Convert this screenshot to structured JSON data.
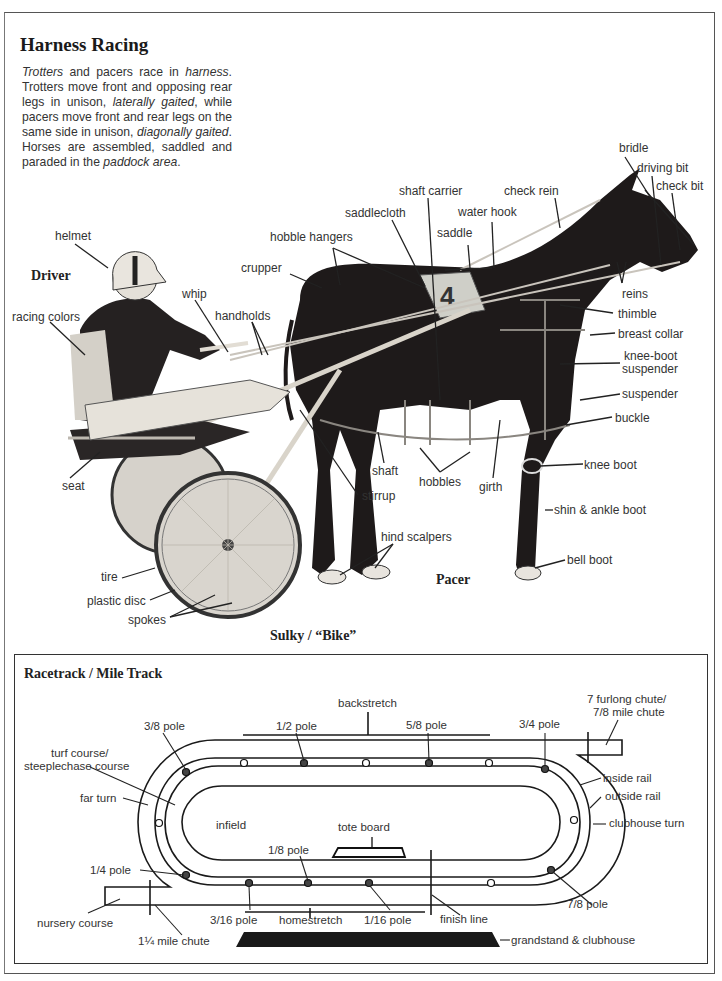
{
  "header": {
    "title": "Harness Racing",
    "intro": [
      {
        "text": "Trotters",
        "italic": true
      },
      {
        "text": " and pacers race in ",
        "italic": false
      },
      {
        "text": "harness",
        "italic": true
      },
      {
        "text": ". Trotters move front and opposing rear legs in unison, ",
        "italic": false
      },
      {
        "text": "laterally gaited",
        "italic": true
      },
      {
        "text": ", while pacers move front and rear legs on the same side in unison, ",
        "italic": false
      },
      {
        "text": "diagonally gaited",
        "italic": true
      },
      {
        "text": ". Horses are assembled, saddled and paraded in the ",
        "italic": false
      },
      {
        "text": "paddock area",
        "italic": true
      },
      {
        "text": ".",
        "italic": false
      }
    ]
  },
  "horse_diagram": {
    "section_labels": {
      "driver": "Driver",
      "pacer": "Pacer",
      "sulky": "Sulky / “Bike”"
    },
    "labels": {
      "helmet": "helmet",
      "racing_colors": "racing colors",
      "whip": "whip",
      "handholds": "handholds",
      "crupper": "crupper",
      "hobble_hangers": "hobble hangers",
      "saddlecloth": "saddlecloth",
      "shaft_carrier": "shaft carrier",
      "saddle": "saddle",
      "water_hook": "water hook",
      "check_rein": "check rein",
      "bridle": "bridle",
      "driving_bit": "driving bit",
      "check_bit": "check bit",
      "reins": "reins",
      "thimble": "thimble",
      "breast_collar": "breast collar",
      "knee_boot_suspender_1": "knee-boot",
      "knee_boot_suspender_2": "suspender",
      "suspender": "suspender",
      "buckle": "buckle",
      "knee_boot": "knee boot",
      "shin_ankle_boot": "shin & ankle boot",
      "bell_boot": "bell boot",
      "seat": "seat",
      "shaft": "shaft",
      "stirrup": "stirrup",
      "hobbles": "hobbles",
      "girth": "girth",
      "hind_scalpers": "hind scalpers",
      "tire": "tire",
      "plastic_disc": "plastic disc",
      "spokes": "spokes"
    }
  },
  "track_diagram": {
    "title": "Racetrack / Mile Track",
    "labels": {
      "backstretch": "backstretch",
      "chute_7f_1": "7 furlong chute/",
      "chute_7f_2": "7/8 mile chute",
      "pole_3_8": "3/8 pole",
      "pole_1_2": "1/2 pole",
      "pole_5_8": "5/8 pole",
      "pole_3_4": "3/4 pole",
      "turf_1": "turf course/",
      "turf_2": "steeplechase course",
      "far_turn": "far turn",
      "inside_rail": "inside rail",
      "outside_rail": "outside rail",
      "clubhouse_turn": "clubhouse turn",
      "infield": "infield",
      "tote_board": "tote board",
      "pole_1_8": "1/8 pole",
      "pole_1_4": "1/4 pole",
      "pole_7_8": "7/8 pole",
      "nursery_course": "nursery course",
      "mile_chute": "1¼ mile chute",
      "pole_3_16": "3/16 pole",
      "homestretch": "homestretch",
      "pole_1_16": "1/16 pole",
      "finish_line": "finish line",
      "grandstand": "grandstand & clubhouse"
    }
  }
}
